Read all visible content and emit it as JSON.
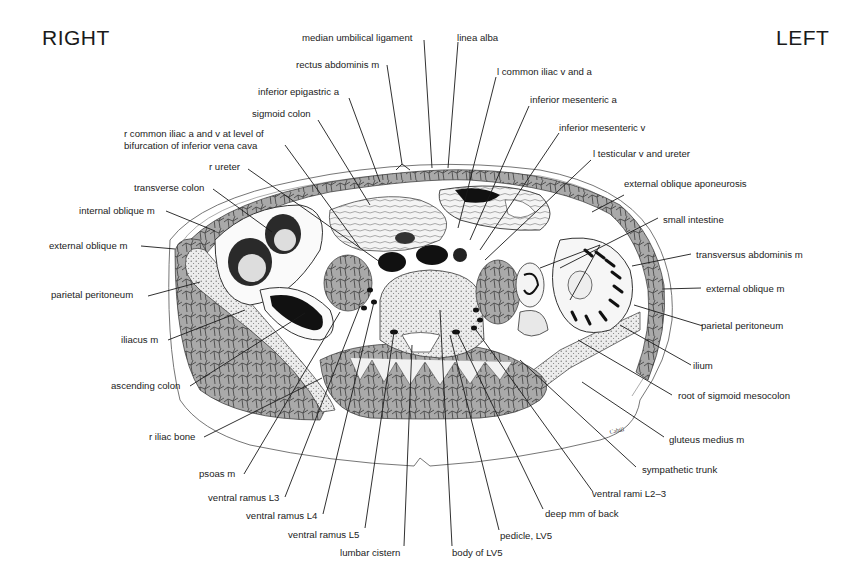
{
  "orientation": {
    "right": "RIGHT",
    "left": "LEFT"
  },
  "signature": "Cahill",
  "labels": {
    "median_umbilical_ligament": "median umbilical ligament",
    "linea_alba": "linea alba",
    "rectus_abdominis_m": "rectus abdominis m",
    "l_common_iliac_v_and_a": "l common iliac v and a",
    "inferior_epigastric_a": "inferior epigastric a",
    "inferior_mesenteric_a": "inferior mesenteric a",
    "sigmoid_colon": "sigmoid colon",
    "inferior_mesenteric_v": "inferior mesenteric v",
    "r_common_iliac_line1": "r common iliac a and v at level of",
    "r_common_iliac_line2": "bifurcation of inferior vena cava",
    "l_testicular_v_and_ureter": "l testicular v and ureter",
    "r_ureter": "r ureter",
    "transverse_colon": "transverse colon",
    "external_oblique_aponeurosis": "external oblique aponeurosis",
    "internal_oblique_m": "internal oblique m",
    "small_intestine": "small intestine",
    "external_oblique_m_right": "external oblique m",
    "transversus_abdominis_m": "transversus abdominis m",
    "parietal_peritoneum_right": "parietal peritoneum",
    "external_oblique_m_left": "external oblique m",
    "parietal_peritoneum_left": "parietal peritoneum",
    "iliacus_m": "iliacus m",
    "ilium": "ilium",
    "ascending_colon": "ascending colon",
    "root_of_sigmoid_mesocolon": "root of sigmoid mesocolon",
    "r_iliac_bone": "r iliac bone",
    "gluteus_medius_m": "gluteus medius m",
    "psoas_m": "psoas m",
    "sympathetic_trunk": "sympathetic trunk",
    "ventral_ramus_l3": "ventral ramus L3",
    "ventral_rami_l2_3": "ventral rami L2–3",
    "ventral_ramus_l4": "ventral ramus L4",
    "deep_mm_of_back": "deep mm of back",
    "ventral_ramus_l5": "ventral ramus L5",
    "pedicle_lv5": "pedicle, LV5",
    "lumbar_cistern": "lumbar cistern",
    "body_of_lv5": "body of LV5"
  }
}
